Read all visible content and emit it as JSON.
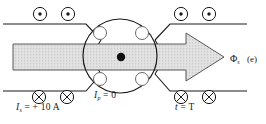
{
  "figure": {
    "panel_label": "(e)",
    "diagram_type": "physics-schematic"
  },
  "labels": {
    "source_current": {
      "symbol": "I",
      "subscript": "s",
      "equals": "= + 10 A",
      "full": "Is = + 10 A"
    },
    "persistent_current": {
      "symbol": "I",
      "subscript": "p",
      "equals": "= 0",
      "full": "Ip = 0"
    },
    "time": {
      "symbol": "t",
      "subscript": "",
      "equals": "= T",
      "full": "t = T"
    },
    "flux": {
      "symbol": "Φ",
      "subscript": "s",
      "full": "Φs"
    }
  },
  "field_markers": {
    "out_of_page_symbol": "⊙",
    "into_page_symbol": "⊗",
    "top_left_count": 2,
    "top_right_count": 2,
    "bottom_left_count": 2,
    "bottom_right_count": 2
  },
  "ring": {
    "coil_cross_sections": 4,
    "center_dot": "out-of-page-flux-dot"
  },
  "colors": {
    "stroke": "#1a1a1a",
    "arrow_fill": "#d9d9d9",
    "arrow_stroke": "#4d4d4d",
    "background": "#ffffff",
    "text": "#1a1a1a"
  }
}
